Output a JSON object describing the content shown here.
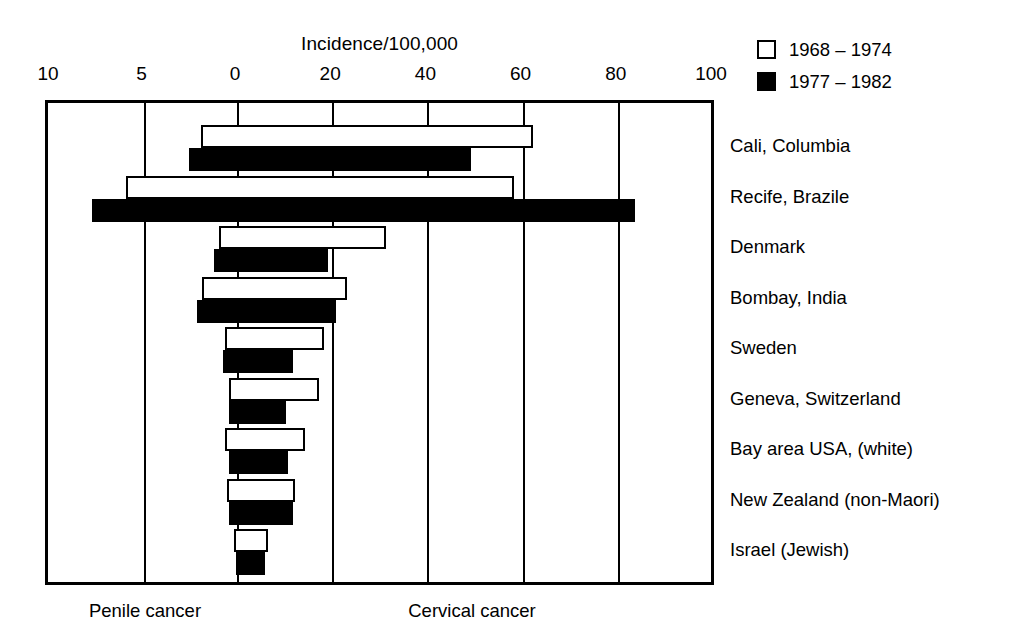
{
  "chart_data": {
    "type": "bar",
    "orientation": "horizontal",
    "style": "back-to-back diverging bar chart",
    "title": "Incidence/100,000",
    "xlabel": "",
    "ylabel": "",
    "grid": true,
    "legend_position": "top-right",
    "left_axis": {
      "name": "Penile cancer",
      "ticks": [
        10,
        5,
        0
      ],
      "tick_labels": [
        "10",
        "5",
        "0"
      ],
      "range": [
        10,
        0
      ],
      "direction": "right-to-left"
    },
    "right_axis": {
      "name": "Cervical cancer",
      "ticks": [
        0,
        20,
        40,
        60,
        80,
        100
      ],
      "tick_labels": [
        "0",
        "20",
        "40",
        "60",
        "80",
        "100"
      ],
      "range": [
        0,
        100
      ],
      "direction": "left-to-right"
    },
    "series": [
      {
        "name": "1968 – 1974",
        "key": "period1",
        "fill": "white",
        "color": "#ffffff"
      },
      {
        "name": "1977 – 1982",
        "key": "period2",
        "fill": "black",
        "color": "#000000"
      }
    ],
    "categories": [
      "Cali, Columbia",
      "Recife, Brazile",
      "Denmark",
      "Bombay, India",
      "Sweden",
      "Geneva, Switzerland",
      "Bay area USA, (white)",
      "New Zealand (non-Maori)",
      "Israel (Jewish)"
    ],
    "rows": [
      {
        "category": "Cali, Columbia",
        "period1": {
          "penile": 2.0,
          "cervical": 62.0
        },
        "period2": {
          "penile": 2.6,
          "cervical": 49.0
        }
      },
      {
        "category": "Recife, Brazile",
        "period1": {
          "penile": 6.0,
          "cervical": 58.0
        },
        "period2": {
          "penile": 7.8,
          "cervical": 83.5
        }
      },
      {
        "category": "Denmark",
        "period1": {
          "penile": 1.0,
          "cervical": 31.0
        },
        "period2": {
          "penile": 1.3,
          "cervical": 19.0
        }
      },
      {
        "category": "Bombay, India",
        "period1": {
          "penile": 1.9,
          "cervical": 23.0
        },
        "period2": {
          "penile": 2.2,
          "cervical": 20.5
        }
      },
      {
        "category": "Sweden",
        "period1": {
          "penile": 0.7,
          "cervical": 18.0
        },
        "period2": {
          "penile": 0.8,
          "cervical": 11.5
        }
      },
      {
        "category": "Geneva, Switzerland",
        "period1": {
          "penile": 0.5,
          "cervical": 17.0
        },
        "period2": {
          "penile": 0.5,
          "cervical": 10.0
        }
      },
      {
        "category": "Bay area USA, (white)",
        "period1": {
          "penile": 0.7,
          "cervical": 14.0
        },
        "period2": {
          "penile": 0.5,
          "cervical": 10.5
        }
      },
      {
        "category": "New Zealand (non-Maori)",
        "period1": {
          "penile": 0.6,
          "cervical": 12.0
        },
        "period2": {
          "penile": 0.5,
          "cervical": 11.5
        }
      },
      {
        "category": "Israel (Jewish)",
        "period1": {
          "penile": 0.2,
          "cervical": 6.2
        },
        "period2": {
          "penile": 0.1,
          "cervical": 5.6
        }
      }
    ]
  },
  "legend": {
    "items": [
      {
        "label": "1968 – 1974",
        "fill": "open"
      },
      {
        "label": "1977 – 1982",
        "fill": "solid"
      }
    ]
  },
  "footer": {
    "left_label": "Penile cancer",
    "right_label": "Cervical cancer"
  },
  "colors": {
    "ink": "#000000",
    "paper": "#ffffff"
  }
}
